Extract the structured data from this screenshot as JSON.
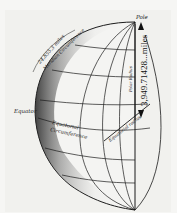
{
  "diagram": {
    "labels": {
      "pole": "Pole",
      "meridian_length": "24,855.3 miles",
      "meridian_name": "Meridian Circumference",
      "polar_radius_name": "Polar Radius",
      "polar_radius_value": "3,949.71428...miles",
      "equator": "Equator",
      "equatorial_circumference_1": "Equatorial",
      "equatorial_circumference_2": "Circumference",
      "equatorial_radius": "Equatorial radius"
    },
    "colors": {
      "ink": "#1a1a1a",
      "paper": "#f1f1ee"
    }
  }
}
